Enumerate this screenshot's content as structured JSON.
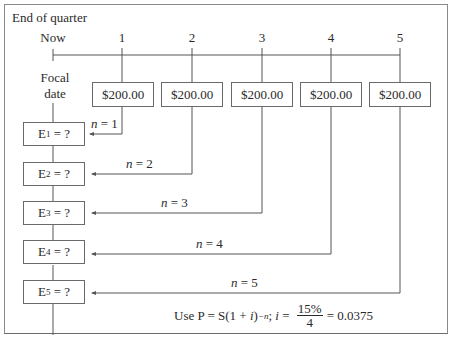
{
  "diagram": {
    "title": "End of quarter",
    "timeline": {
      "now_label": "Now",
      "period_labels": [
        "1",
        "2",
        "3",
        "4",
        "5"
      ]
    },
    "focal_date_label_line1": "Focal",
    "focal_date_label_line2": "date",
    "payments": [
      {
        "period": "1",
        "amount": "$200.00"
      },
      {
        "period": "2",
        "amount": "$200.00"
      },
      {
        "period": "3",
        "amount": "$200.00"
      },
      {
        "period": "4",
        "amount": "$200.00"
      },
      {
        "period": "5",
        "amount": "$200.00"
      }
    ],
    "equivalents": [
      {
        "letter": "E",
        "sub": "1",
        "rest": " = ?",
        "n_var": "n",
        "n_rest": " = 1"
      },
      {
        "letter": "E",
        "sub": "2",
        "rest": " = ?",
        "n_var": "n",
        "n_rest": " = 2"
      },
      {
        "letter": "E",
        "sub": "3",
        "rest": " = ?",
        "n_var": "n",
        "n_rest": " = 3"
      },
      {
        "letter": "E",
        "sub": "4",
        "rest": " = ?",
        "n_var": "n",
        "n_rest": " = 4"
      },
      {
        "letter": "E",
        "sub": "5",
        "rest": " = ?",
        "n_var": "n",
        "n_rest": " = 5"
      }
    ],
    "formula": {
      "prefix": "Use P = S(1 + ",
      "i_var": "i",
      "close": ")",
      "exponent": "−n",
      "sep": "; ",
      "i_var2": "i",
      "eq": " = ",
      "numerator": "15%",
      "denominator": "4",
      "result": "= 0.0375"
    }
  }
}
